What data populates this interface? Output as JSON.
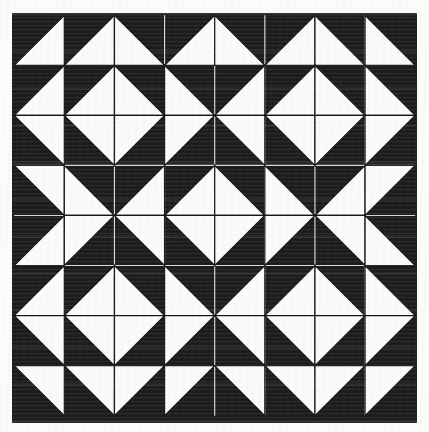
{
  "image": {
    "description": "Scanned black-and-white geometric quilt block pattern made of half-square triangles forming diamonds, hourglasses and arrows",
    "colors": {
      "page_background": "#fbfbf9",
      "ink_black": "#1c1c1c",
      "patch_white": "#fafaf8",
      "gridline_on_black": "#d8d8d4",
      "outline_on_white": "#161616"
    },
    "grid_rows": 8,
    "grid_cols": 8,
    "cell_legend": {
      "lr": "white triangle filling lower-right half of cell",
      "ll": "white triangle filling lower-left half of cell",
      "ur": "white triangle filling upper-right half of cell",
      "ul": "white triangle filling upper-left half of cell"
    },
    "cells": [
      [
        "lr",
        "lr",
        "ll",
        "lr",
        "ll",
        "lr",
        "ll",
        "ll"
      ],
      [
        "lr",
        "lr",
        "ll",
        "ll",
        "lr",
        "lr",
        "ll",
        "ll"
      ],
      [
        "ur",
        "ur",
        "ul",
        "ul",
        "ur",
        "ur",
        "ul",
        "ul"
      ],
      [
        "ur",
        "ll",
        "lr",
        "lr",
        "ll",
        "ll",
        "lr",
        "ul"
      ],
      [
        "lr",
        "ul",
        "ur",
        "ur",
        "ul",
        "ul",
        "ur",
        "ll"
      ],
      [
        "lr",
        "lr",
        "ll",
        "ll",
        "lr",
        "lr",
        "ll",
        "ll"
      ],
      [
        "ur",
        "ur",
        "ul",
        "ul",
        "ur",
        "ur",
        "ul",
        "ul"
      ],
      [
        "ur",
        "ur",
        "ul",
        "ul",
        "ur",
        "ur",
        "ul",
        "ul"
      ]
    ]
  },
  "layout": {
    "canvas": {
      "width": 429,
      "height": 432
    },
    "black_square": {
      "x": 12,
      "y": 13,
      "w": 405,
      "h": 410
    },
    "pattern_area": {
      "x": 14.2,
      "y": 15.2,
      "w": 401.0,
      "h": 400.5
    },
    "hairline_width": 1.15,
    "triangle_outline_width": 1.25
  }
}
